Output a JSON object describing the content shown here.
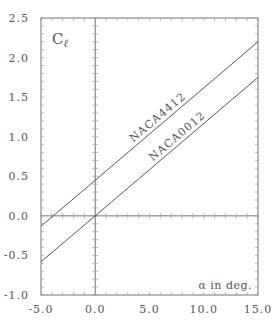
{
  "chart_data": {
    "type": "line",
    "title": "",
    "xlabel": "α in deg.",
    "ylabel": "Cℓ",
    "xlim": [
      -5.0,
      15.0
    ],
    "ylim": [
      -1.0,
      2.5
    ],
    "x_ticks": [
      "-5.0",
      "0.0",
      "5.0",
      "10.0",
      "15.0"
    ],
    "y_ticks": [
      "-1.0",
      "-0.5",
      "0.0",
      "0.5",
      "1.0",
      "1.5",
      "2.0",
      "2.5"
    ],
    "grid": false,
    "axes_through_origin": true,
    "series": [
      {
        "name": "NACA4412",
        "x": [
          -5.0,
          0.0,
          15.0
        ],
        "y": [
          -0.13,
          0.45,
          2.2
        ]
      },
      {
        "name": "NACA0012",
        "x": [
          -5.0,
          0.0,
          15.0
        ],
        "y": [
          -0.58,
          0.0,
          1.75
        ]
      }
    ],
    "annotations": [
      {
        "text": "NACA4412",
        "on_series": "NACA4412"
      },
      {
        "text": "NACA0012",
        "on_series": "NACA0012"
      }
    ]
  },
  "labels": {
    "y_axis_symbol": "C",
    "y_axis_subscript": "ℓ",
    "x_axis_label": "α  in deg."
  }
}
